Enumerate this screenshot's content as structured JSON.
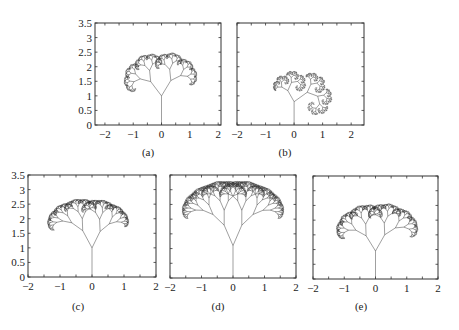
{
  "figure": {
    "panels": [
      {
        "id": "a",
        "caption": "(a)",
        "box": {
          "x": 95,
          "y": 23,
          "w": 126,
          "h": 102
        },
        "caption_pos": {
          "x": 148,
          "y": 146
        },
        "show_y_labels": true,
        "xlim": [
          -2.35,
          2.1
        ],
        "ylim": [
          0,
          3.5
        ],
        "xticks": [
          -2,
          -1,
          0,
          1,
          2
        ],
        "xtick_labels": [
          "−2",
          "−1",
          "0",
          "1",
          "2"
        ],
        "yticks": [
          0,
          0.5,
          1,
          1.5,
          2,
          2.5,
          3,
          3.5
        ],
        "ytick_labels": [
          "0",
          "0.5",
          "1",
          "1.5",
          "2",
          "2.5",
          "3",
          "3.5"
        ],
        "tree": {
          "trunk": 1.0,
          "ratio_left": 0.62,
          "ratio_right": 0.62,
          "angle_left": 38,
          "angle_right": 32,
          "depth": 10
        }
      },
      {
        "id": "b",
        "caption": "(b)",
        "box": {
          "x": 237,
          "y": 23,
          "w": 127,
          "h": 102
        },
        "caption_pos": {
          "x": 285,
          "y": 146
        },
        "show_y_labels": false,
        "xlim": [
          -2,
          2.45
        ],
        "ylim": [
          0,
          3.5
        ],
        "xticks": [
          -2,
          -1,
          0,
          1,
          2
        ],
        "xtick_labels": [
          "−2",
          "−1",
          "0",
          "1",
          "2"
        ],
        "yticks": [
          0,
          0.5,
          1,
          1.5,
          2,
          2.5,
          3,
          3.5
        ],
        "ytick_labels": [],
        "tree": {
          "trunk": 0.8,
          "ratio_left": 0.55,
          "ratio_right": 0.7,
          "angle_left": 30,
          "angle_right": 55,
          "depth": 10
        }
      },
      {
        "id": "c",
        "caption": "(c)",
        "box": {
          "x": 28,
          "y": 175,
          "w": 128,
          "h": 102
        },
        "caption_pos": {
          "x": 78,
          "y": 300
        },
        "show_y_labels": true,
        "xlim": [
          -2,
          2
        ],
        "ylim": [
          0,
          3.5
        ],
        "xticks": [
          -2,
          -1,
          0,
          1,
          2
        ],
        "xtick_labels": [
          "−2",
          "−1",
          "0",
          "1",
          "2"
        ],
        "yticks": [
          0,
          0.5,
          1,
          1.5,
          2,
          2.5,
          3,
          3.5
        ],
        "ytick_labels": [
          "0",
          "0.5",
          "1",
          "1.5",
          "2",
          "2.5",
          "3",
          "3.5"
        ],
        "tree": {
          "trunk": 1.0,
          "ratio_left": 0.66,
          "ratio_right": 0.62,
          "angle_left": 26,
          "angle_right": 24,
          "depth": 10
        }
      },
      {
        "id": "d",
        "caption": "(d)",
        "box": {
          "x": 170,
          "y": 175,
          "w": 126,
          "h": 103
        },
        "caption_pos": {
          "x": 218,
          "y": 300
        },
        "show_y_labels": false,
        "xlim": [
          -2,
          2
        ],
        "ylim": [
          0,
          3.5
        ],
        "xticks": [
          -2,
          -1,
          0,
          1,
          2
        ],
        "xtick_labels": [
          "−2",
          "−1",
          "0",
          "1",
          "2"
        ],
        "yticks": [
          0,
          0.5,
          1,
          1.5,
          2,
          2.5,
          3,
          3.5
        ],
        "ytick_labels": [],
        "tree": {
          "trunk": 1.1,
          "ratio_left": 0.68,
          "ratio_right": 0.68,
          "angle_left": 22,
          "angle_right": 22,
          "depth": 10
        }
      },
      {
        "id": "e",
        "caption": "(e)",
        "box": {
          "x": 313,
          "y": 176,
          "w": 125,
          "h": 103
        },
        "caption_pos": {
          "x": 361,
          "y": 300
        },
        "show_y_labels": false,
        "xlim": [
          -2,
          2
        ],
        "ylim": [
          0,
          3.5
        ],
        "xticks": [
          -2,
          -1,
          0,
          1,
          2
        ],
        "xtick_labels": [
          "−2",
          "−1",
          "0",
          "1",
          "2"
        ],
        "yticks": [
          0,
          0.5,
          1,
          1.5,
          2,
          2.5,
          3,
          3.5
        ],
        "ytick_labels": [],
        "tree": {
          "trunk": 0.95,
          "ratio_left": 0.63,
          "ratio_right": 0.66,
          "angle_left": 30,
          "angle_right": 28,
          "depth": 10
        }
      }
    ]
  },
  "colors": {
    "line": "#2a2a2a",
    "axis": "#333333",
    "background": "#ffffff"
  }
}
